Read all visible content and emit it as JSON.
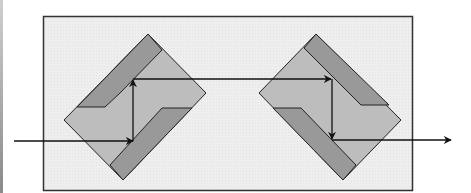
{
  "diagram": {
    "title": "",
    "colors": {
      "background": "#ffffff",
      "panel_fill": "#eeeeee",
      "panel_stroke": "#333333",
      "prism_body": "#bdbdbd",
      "prism_mirror": "#999999",
      "outline": "#222222",
      "beam": "#111111"
    },
    "elements": [
      {
        "id": "panel",
        "type": "rectangle"
      },
      {
        "id": "prism-left",
        "type": "rotated-prism",
        "orientation": "rotated 45deg, mirrors upper-left and lower-right"
      },
      {
        "id": "prism-right",
        "type": "rotated-prism",
        "orientation": "rotated -45deg, mirrors upper-right and lower-left"
      },
      {
        "id": "beam-in",
        "type": "arrow",
        "direction": "right"
      },
      {
        "id": "beam-up",
        "type": "arrow",
        "direction": "up"
      },
      {
        "id": "beam-across",
        "type": "arrow",
        "direction": "right"
      },
      {
        "id": "beam-down",
        "type": "arrow",
        "direction": "down"
      },
      {
        "id": "beam-out",
        "type": "arrow",
        "direction": "right"
      }
    ],
    "labels": []
  }
}
